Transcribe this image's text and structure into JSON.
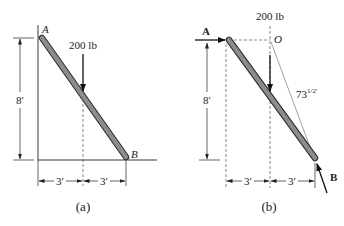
{
  "figure": {
    "panels": [
      {
        "id": "a",
        "caption": "(a)",
        "point_labels": {
          "top": "A",
          "bottom": "B"
        },
        "force_label": "200 lb",
        "height_dim": "8′",
        "horiz_dims": [
          "3′",
          "3′"
        ]
      },
      {
        "id": "b",
        "caption": "(b)",
        "point_labels": {
          "top": "A",
          "bottom": "B",
          "pivot": "O"
        },
        "force_label": "200 lb",
        "height_dim": "8′",
        "horiz_dims": [
          "3′",
          "3′"
        ],
        "diag_dim": "73",
        "diag_dim_exp": "1/2′"
      }
    ],
    "colors": {
      "rod_fill": "#8c8c8c",
      "rod_edge": "#2b2b2b",
      "line": "#222222",
      "dash": "#555555"
    }
  }
}
